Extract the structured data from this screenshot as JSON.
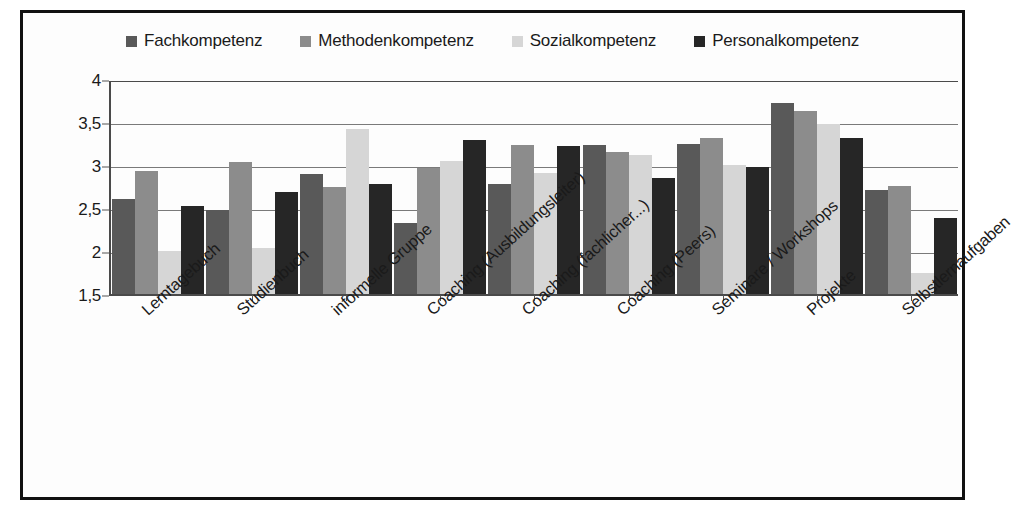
{
  "chart_data": {
    "type": "bar",
    "title": "",
    "subtitle": "",
    "xlabel": "",
    "ylabel": "",
    "ylim": [
      1.5,
      4
    ],
    "y_ticks": [
      1.5,
      2,
      2.5,
      3,
      3.5,
      4
    ],
    "y_tick_labels": [
      "1,5",
      "2",
      "2,5",
      "3",
      "3,5",
      "4"
    ],
    "grid": true,
    "legend_position": "top-center",
    "categories": [
      "Lerntagebuch",
      "Studienbuch",
      "informelle Gruppe",
      "Coaching (Ausbildungsleiter)",
      "Coaching (fachlicher...)",
      "Coaching (Peers)",
      "Seminare / Workshops",
      "Projekte",
      "Selbstlernaufgaben"
    ],
    "series": [
      {
        "name": "Fachkompetenz",
        "color": "#595959",
        "values": [
          2.61,
          2.48,
          2.89,
          2.33,
          2.78,
          3.23,
          3.25,
          3.72,
          2.71
        ]
      },
      {
        "name": "Methodenkompetenz",
        "color": "#8c8c8c",
        "values": [
          2.93,
          3.03,
          2.75,
          2.96,
          3.23,
          3.15,
          3.31,
          3.63,
          2.76
        ]
      },
      {
        "name": "Sozialkompetenz",
        "color": "#d6d6d6",
        "values": [
          2.0,
          2.03,
          3.42,
          3.05,
          2.91,
          3.12,
          3.0,
          3.48,
          1.75
        ]
      },
      {
        "name": "Personalkompetenz",
        "color": "#262626",
        "values": [
          2.52,
          2.69,
          2.78,
          3.29,
          3.22,
          2.85,
          2.98,
          3.31,
          2.38
        ]
      }
    ]
  },
  "frame": {
    "border_color": "#111111",
    "background": "#fdfdfd"
  }
}
